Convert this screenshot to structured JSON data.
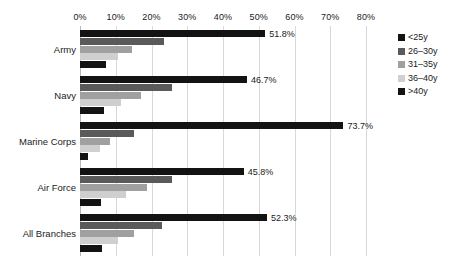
{
  "chart_data": {
    "type": "bar",
    "orientation": "horizontal",
    "title": "",
    "subtitle": "",
    "xlabel": "",
    "ylabel": "",
    "xlim": [
      0,
      80
    ],
    "grid": true,
    "legend_position": "right",
    "x_tick_labels": [
      "0%",
      "10%",
      "20%",
      "30%",
      "40%",
      "50%",
      "60%",
      "70%",
      "80%"
    ],
    "x_tick_values": [
      0,
      10,
      20,
      30,
      40,
      50,
      60,
      70,
      80
    ],
    "categories": [
      "Army",
      "Navy",
      "Marine Corps",
      "Air Force",
      "All Branches"
    ],
    "series": [
      {
        "name": "<25y",
        "color": "#131313",
        "values": [
          51.8,
          46.7,
          73.7,
          45.8,
          52.3
        ],
        "labels": [
          "51.8%",
          "46.7%",
          "73.7%",
          "45.8%",
          "52.3%"
        ]
      },
      {
        "name": "26–30y",
        "color": "#5a5a5a",
        "values": [
          23.5,
          25.7,
          15.0,
          25.7,
          23.0
        ],
        "labels": [
          "",
          "",
          "",
          "",
          ""
        ]
      },
      {
        "name": "31–35y",
        "color": "#a0a0a0",
        "values": [
          14.5,
          17.0,
          8.5,
          18.7,
          15.0
        ],
        "labels": [
          "",
          "",
          "",
          "",
          ""
        ]
      },
      {
        "name": "36–40y",
        "color": "#cfcfcf",
        "values": [
          10.5,
          11.5,
          5.5,
          13.0,
          10.5
        ],
        "labels": [
          "",
          "",
          "",
          "",
          ""
        ]
      },
      {
        "name": ">40y",
        "color": "#131313",
        "values": [
          7.3,
          6.7,
          2.3,
          6.0,
          6.2
        ],
        "labels": [
          "",
          "",
          "",
          "",
          ""
        ]
      }
    ]
  }
}
